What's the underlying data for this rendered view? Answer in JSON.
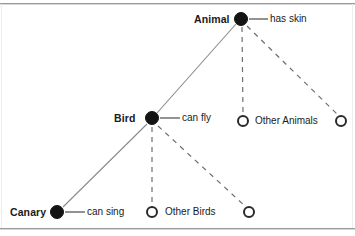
{
  "figure": {
    "background_color": "#ffffff",
    "node_fill_color": "#141414",
    "node_stroke_color": "#2a2a2a",
    "solid_link_color": "#8a8a8a",
    "dashed_link_color": "#6e6e6e",
    "text_color": "#1a1a1a"
  },
  "concepts": {
    "animal": {
      "label": "Animal",
      "property": "has skin"
    },
    "bird": {
      "label": "Bird",
      "property": "can fly"
    },
    "canary": {
      "label": "Canary",
      "property": "can sing"
    }
  },
  "groups": {
    "other_animals": {
      "label": "Other Animals"
    },
    "other_birds": {
      "label": "Other Birds"
    }
  }
}
